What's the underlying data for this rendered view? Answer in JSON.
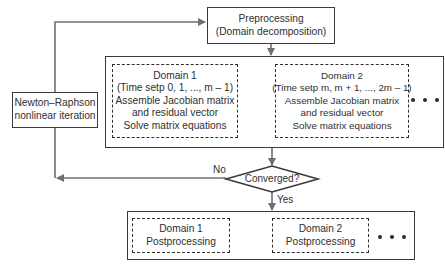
{
  "diagram": {
    "preprocessing": {
      "line1": "Preprocessing",
      "line2": "(Domain decomposition)"
    },
    "newton_raphson": {
      "line1": "Newton–Raphson",
      "line2": "nonlinear iteration"
    },
    "domain1": {
      "line1": "Domain 1",
      "line2": "(Time setp 0, 1, ..., m – 1)",
      "line3": "Assemble Jacobian matrix",
      "line4": "and residual vector",
      "line5": "Solve matrix equations"
    },
    "domain2": {
      "line1": "Domain 2",
      "line2": "(Time setp m, m + 1, ..., 2m – 1)",
      "line3": "Assemble Jacobian matrix",
      "line4": "and residual vector",
      "line5": "Solve matrix equations"
    },
    "decision": {
      "label": "Converged?",
      "no_label": "No",
      "yes_label": "Yes"
    },
    "post1": {
      "line1": "Domain 1",
      "line2": "Postprocessing"
    },
    "post2": {
      "line1": "Domain 2",
      "line2": "Postprocessing"
    },
    "colors": {
      "box_border": "#3a3a3a",
      "arrow": "#6f6f6f",
      "text": "#2f2f2f",
      "background": "#ffffff"
    }
  }
}
